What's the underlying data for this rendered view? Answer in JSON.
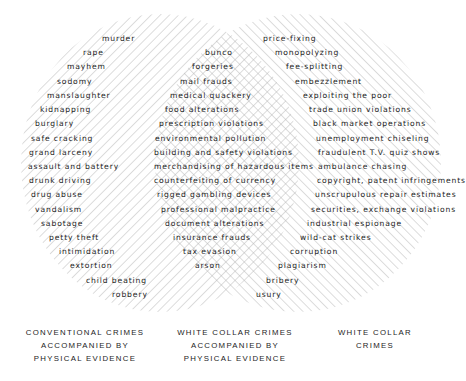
{
  "colors": {
    "background": "#ffffff",
    "ink": "#1c1c1c",
    "hatch": "#b4b4b4"
  },
  "diagram": {
    "type": "venn",
    "circles": [
      {
        "id": "left",
        "hatch": "backslash",
        "cx": 160,
        "cy": 163,
        "rx": 139,
        "ry": 149
      },
      {
        "id": "right",
        "hatch": "slash",
        "cx": 298,
        "cy": 163,
        "rx": 143,
        "ry": 149
      }
    ]
  },
  "left_only": {
    "items": [
      {
        "text": "murder",
        "x": 102,
        "y": 34
      },
      {
        "text": "rape",
        "x": 83,
        "y": 48
      },
      {
        "text": "mayhem",
        "x": 67,
        "y": 62
      },
      {
        "text": "sodomy",
        "x": 57,
        "y": 77
      },
      {
        "text": "manslaughter",
        "x": 47,
        "y": 91
      },
      {
        "text": "kidnapping",
        "x": 40,
        "y": 105
      },
      {
        "text": "burglary",
        "x": 35,
        "y": 119
      },
      {
        "text": "safe cracking",
        "x": 31,
        "y": 134
      },
      {
        "text": "grand larceny",
        "x": 29,
        "y": 148
      },
      {
        "text": "assault and battery",
        "x": 28,
        "y": 162
      },
      {
        "text": "drunk driving",
        "x": 29,
        "y": 176
      },
      {
        "text": "drug abuse",
        "x": 31,
        "y": 190
      },
      {
        "text": "vandalism",
        "x": 35,
        "y": 205
      },
      {
        "text": "sabotage",
        "x": 41,
        "y": 219
      },
      {
        "text": "petty theft",
        "x": 49,
        "y": 233
      },
      {
        "text": "intimidation",
        "x": 59,
        "y": 247
      },
      {
        "text": "extortion",
        "x": 70,
        "y": 261
      },
      {
        "text": "child beating",
        "x": 86,
        "y": 276
      },
      {
        "text": "robbery",
        "x": 112,
        "y": 290
      }
    ]
  },
  "overlap": {
    "items": [
      {
        "text": "bunco",
        "x": 205,
        "y": 48
      },
      {
        "text": "forgeries",
        "x": 192,
        "y": 62
      },
      {
        "text": "mail frauds",
        "x": 180,
        "y": 77
      },
      {
        "text": "medical quackery",
        "x": 170,
        "y": 91
      },
      {
        "text": "food alterations",
        "x": 165,
        "y": 105
      },
      {
        "text": "prescription violations",
        "x": 159,
        "y": 119
      },
      {
        "text": "environmental pollution",
        "x": 155,
        "y": 134
      },
      {
        "text": "building and safety violations",
        "x": 154,
        "y": 148
      },
      {
        "text": "merchandising of hazardous items",
        "x": 154,
        "y": 162
      },
      {
        "text": "counterfeiting of currency",
        "x": 154,
        "y": 176
      },
      {
        "text": "rigged gambling devices",
        "x": 157,
        "y": 190
      },
      {
        "text": "professional malpractice",
        "x": 161,
        "y": 205
      },
      {
        "text": "document alterations",
        "x": 165,
        "y": 219
      },
      {
        "text": "insurance frauds",
        "x": 173,
        "y": 233
      },
      {
        "text": "tax evasion",
        "x": 183,
        "y": 247
      },
      {
        "text": "arson",
        "x": 195,
        "y": 261
      }
    ]
  },
  "right_only": {
    "items": [
      {
        "text": "price-fixing",
        "x": 263,
        "y": 34
      },
      {
        "text": "monopolyzing",
        "x": 275,
        "y": 48
      },
      {
        "text": "fee-splitting",
        "x": 286,
        "y": 62
      },
      {
        "text": "embezzlement",
        "x": 295,
        "y": 77
      },
      {
        "text": "exploiting the poor",
        "x": 303,
        "y": 91
      },
      {
        "text": "trade union violations",
        "x": 309,
        "y": 105
      },
      {
        "text": "black market operations",
        "x": 313,
        "y": 119
      },
      {
        "text": "unemployment chiseling",
        "x": 316,
        "y": 134
      },
      {
        "text": "fraudulent T.V. quiz shows",
        "x": 318,
        "y": 148
      },
      {
        "text": "ambulance chasing",
        "x": 318,
        "y": 162
      },
      {
        "text": "copyright, patent infringements",
        "x": 317,
        "y": 176
      },
      {
        "text": "unscrupulous repair estimates",
        "x": 315,
        "y": 190
      },
      {
        "text": "securities, exchange violations",
        "x": 311,
        "y": 205
      },
      {
        "text": "industrial espionage",
        "x": 307,
        "y": 219
      },
      {
        "text": "wild-cat strikes",
        "x": 300,
        "y": 233
      },
      {
        "text": "corruption",
        "x": 290,
        "y": 247
      },
      {
        "text": "plagiarism",
        "x": 278,
        "y": 261
      },
      {
        "text": "bribery",
        "x": 266,
        "y": 276
      },
      {
        "text": "usury",
        "x": 256,
        "y": 290
      }
    ]
  },
  "captions": [
    {
      "lines": [
        "CONVENTIONAL CRIMES",
        "ACCOMPANIED BY",
        "PHYSICAL EVIDENCE"
      ],
      "x": 20,
      "w": 130
    },
    {
      "lines": [
        "WHITE COLLAR CRIMES",
        "ACCOMPANIED BY",
        "PHYSICAL EVIDENCE"
      ],
      "x": 170,
      "w": 130
    },
    {
      "lines": [
        "WHITE COLLAR",
        "CRIMES"
      ],
      "x": 320,
      "w": 110
    }
  ]
}
